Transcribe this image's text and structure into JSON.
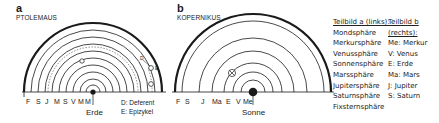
{
  "panel_a": {
    "letter": "a",
    "title": "PTOLEMAUS",
    "center_label": "Erde",
    "axis_labels": [
      "F",
      "S",
      "J",
      "M",
      "S",
      "V",
      "M",
      "M"
    ],
    "notes": [
      "D: Deferent",
      "E: Epizykel"
    ],
    "marker_labels": [
      "D",
      "E"
    ]
  },
  "panel_b": {
    "letter": "b",
    "title": "KOPERNIKUS",
    "center_label": "Sonne",
    "axis_labels": [
      "F",
      "S",
      "J",
      "Ma",
      "E",
      "V",
      "Me"
    ]
  },
  "legend": {
    "col_a": {
      "header": "Teilbild a (links):",
      "items": [
        "Mondsphäre",
        "Merkursphäre",
        "Venussphäre",
        "Sonnensphäre",
        "Marssphäre",
        "Jupitersphäre",
        "Saturnsphäre",
        "Fixsternsphäre"
      ]
    },
    "col_b": {
      "header_1": "Teilbild b",
      "header_2": "(rechts):",
      "items": [
        "Me: Merkur",
        "V: Venus",
        "E: Erde",
        "Ma: Mars",
        "J: Jupiter",
        "S: Saturn"
      ]
    }
  },
  "colors": {
    "ink": "#1a1a1a",
    "background": "#ffffff"
  }
}
